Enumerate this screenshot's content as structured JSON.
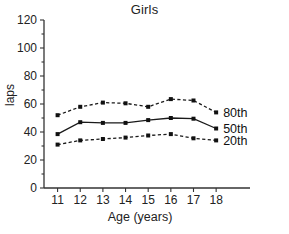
{
  "chart_data": {
    "type": "line",
    "title": "Girls",
    "xlabel": "Age (years)",
    "ylabel": "laps",
    "x": [
      11,
      12,
      13,
      14,
      15,
      16,
      17,
      18
    ],
    "xtick_labels": [
      "11",
      "12",
      "13",
      "14",
      "15",
      "16",
      "17",
      "18"
    ],
    "ytick_labels": [
      "0",
      "20",
      "40",
      "60",
      "80",
      "100",
      "120"
    ],
    "yticks": [
      0,
      20,
      40,
      60,
      80,
      100,
      120
    ],
    "xlim": [
      10.4,
      18.7
    ],
    "ylim": [
      0,
      120
    ],
    "grid": false,
    "legend_position": "right-inline",
    "series": [
      {
        "name": "80th",
        "label": "80th",
        "style": "dashed",
        "values": [
          52,
          58,
          61,
          60.5,
          58,
          63.5,
          62.5,
          54
        ]
      },
      {
        "name": "50th",
        "label": "50th",
        "style": "solid",
        "values": [
          38.5,
          47,
          46.5,
          46.5,
          48.5,
          50,
          49.5,
          42.5
        ]
      },
      {
        "name": "20th",
        "label": "20th",
        "style": "dashed",
        "values": [
          31,
          34,
          35,
          36,
          37.5,
          38.5,
          35.5,
          34
        ]
      }
    ]
  },
  "colors": {
    "ink": "#1a1a1a",
    "axis": "#333333",
    "background": "#ffffff"
  }
}
